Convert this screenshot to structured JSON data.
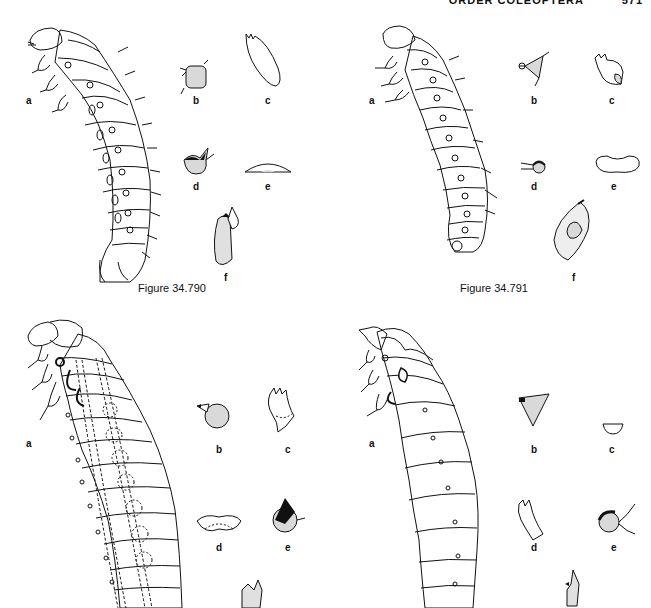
{
  "header": {
    "running_title": "ORDER COLEOPTERA",
    "page_number": "571"
  },
  "figures": [
    {
      "id": "fig-34-790",
      "caption": "Figure 34.790",
      "panels": [
        "a",
        "b",
        "c",
        "d",
        "e",
        "f"
      ]
    },
    {
      "id": "fig-34-791",
      "caption": "Figure 34.791",
      "panels": [
        "a",
        "b",
        "c",
        "d",
        "e",
        "f"
      ]
    },
    {
      "id": "fig-34-792",
      "caption": "",
      "panels": [
        "a",
        "b",
        "c",
        "d",
        "e"
      ]
    },
    {
      "id": "fig-34-793",
      "caption": "",
      "panels": [
        "a",
        "b",
        "c",
        "d",
        "e"
      ]
    }
  ],
  "colors": {
    "ink": "#111111",
    "paper": "#ffffff",
    "stipple": "#cfcfcf"
  }
}
